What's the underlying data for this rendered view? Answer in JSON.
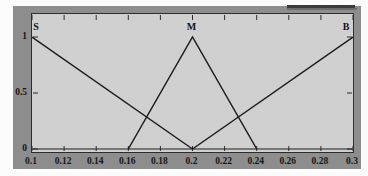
{
  "chart_data": {
    "type": "line",
    "title": "",
    "subtitle": "",
    "xlabel": "",
    "ylabel": "",
    "xlim": [
      0.1,
      0.3
    ],
    "ylim": [
      0,
      1
    ],
    "grid": false,
    "legend_position": "in-plot-labels",
    "xticks": [
      "0.1",
      "0.12",
      "0.14",
      "0.16",
      "0.18",
      "0.2",
      "0.22",
      "0.24",
      "0.26",
      "0.28",
      "0.3"
    ],
    "xtick_values": [
      0.1,
      0.12,
      0.14,
      0.16,
      0.18,
      0.2,
      0.22,
      0.24,
      0.26,
      0.28,
      0.3
    ],
    "yticks": [
      "0",
      "0.5",
      "1"
    ],
    "ytick_values": [
      0,
      0.5,
      1
    ],
    "series": [
      {
        "name": "S",
        "label": "S",
        "label_x": 0.1,
        "label_y": 1,
        "x": [
          0.1,
          0.2
        ],
        "values": [
          1,
          0
        ]
      },
      {
        "name": "M",
        "label": "M",
        "label_x": 0.2,
        "label_y": 1,
        "x": [
          0.16,
          0.2,
          0.24
        ],
        "values": [
          0,
          1,
          0
        ]
      },
      {
        "name": "B",
        "label": "B",
        "label_x": 0.3,
        "label_y": 1,
        "x": [
          0.2,
          0.3
        ],
        "values": [
          0,
          1
        ]
      }
    ],
    "annotations": [
      {
        "text": "S",
        "x": 0.1,
        "y": 1
      },
      {
        "text": "M",
        "x": 0.2,
        "y": 1
      },
      {
        "text": "B",
        "x": 0.3,
        "y": 1
      }
    ],
    "colors": {
      "line": "#1a1a1a",
      "axis": "#2b2b2b",
      "plot_background": "#d2d2d2",
      "figure_background": "#8e8e8e",
      "tick_text": "#141414"
    }
  }
}
